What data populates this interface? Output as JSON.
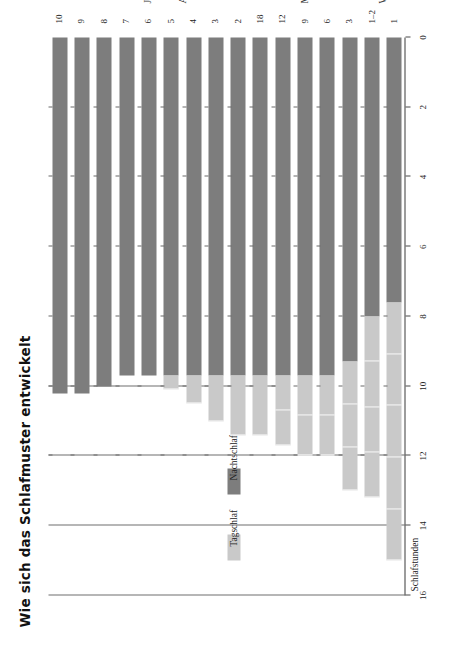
{
  "title": "Wie sich das Schlafmuster entwickelt",
  "legend": {
    "items": [
      {
        "label": "Tagschlaf",
        "color": "#c9c9c9"
      },
      {
        "label": "Nachtschlaf",
        "color": "#7d7d7d"
      }
    ]
  },
  "axes": {
    "value_title": "Schlafstunden",
    "category_title": "Alter",
    "value_ticks": [
      "16",
      "14",
      "12",
      "10",
      "8",
      "6",
      "4",
      "2",
      "0"
    ],
    "group_labels": [
      "Wochen",
      "Monate",
      "Jahre"
    ]
  },
  "chart_data": {
    "type": "bar",
    "title": "Wie sich das Schlafmuster entwickelt",
    "xlabel": "Alter",
    "ylabel": "Schlafstunden",
    "ylim": [
      0,
      16
    ],
    "grid": false,
    "legend_position": "left",
    "orientation": "horizontal-rotated",
    "value_axis_reversed": true,
    "categories": [
      "1",
      "1–2",
      "3",
      "6",
      "9",
      "12",
      "18",
      "2",
      "3",
      "4",
      "5",
      "6",
      "7",
      "8",
      "9",
      "10"
    ],
    "category_groups": [
      {
        "label": "Wochen",
        "from": 0,
        "to": 1
      },
      {
        "label": "Monate",
        "from": 2,
        "to": 6
      },
      {
        "label": "Jahre",
        "from": 7,
        "to": 15
      }
    ],
    "series": [
      {
        "name": "Nachtschlaf",
        "color": "#7d7d7d",
        "values": [
          7.6,
          8.0,
          9.3,
          9.7,
          9.7,
          9.7,
          9.7,
          9.7,
          9.7,
          9.7,
          9.7,
          9.7,
          9.7,
          10.0,
          10.2,
          10.2
        ]
      },
      {
        "name": "Tagschlaf",
        "color": "#c9c9c9",
        "values": [
          7.4,
          5.2,
          3.7,
          2.3,
          2.3,
          2.0,
          1.7,
          1.7,
          1.3,
          0.8,
          0.4,
          0,
          0,
          0,
          0,
          0
        ]
      }
    ],
    "daytime_naps": [
      5,
      4,
      3,
      2,
      2,
      2,
      1,
      1,
      1,
      1,
      1,
      0,
      0,
      0,
      0,
      0
    ],
    "totals": [
      15.0,
      13.2,
      13.0,
      12.0,
      12.0,
      11.7,
      11.4,
      11.4,
      11.0,
      10.5,
      10.1,
      9.7,
      9.7,
      10.0,
      10.2,
      10.2
    ]
  }
}
